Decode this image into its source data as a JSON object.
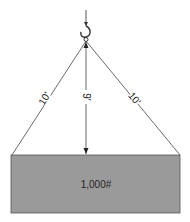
{
  "diagram": {
    "sling_left_length": "10'",
    "sling_right_length": "10'",
    "vertical_height": "9'",
    "load_label": "1,000#",
    "colors": {
      "load_fill": "#9a9a9a",
      "line": "#333333",
      "background": "#ffffff"
    }
  }
}
